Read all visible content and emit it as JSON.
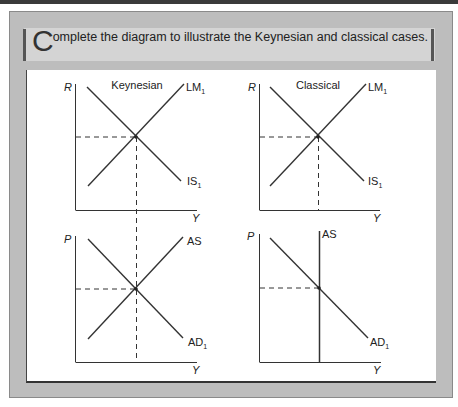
{
  "header": {
    "instruction_dropcap": "C",
    "instruction_rest": "omplete the diagram to illustrate the Keynesian and classical cases."
  },
  "panels": {
    "keynesian_islm": {
      "title": "Keynesian",
      "y_axis_label": "R",
      "x_axis_label": "Y",
      "curve_1_label": "LM",
      "curve_1_sub": "1",
      "curve_2_label": "IS",
      "curve_2_sub": "1"
    },
    "classical_islm": {
      "title": "Classical",
      "y_axis_label": "R",
      "x_axis_label": "Y",
      "curve_1_label": "LM",
      "curve_1_sub": "1",
      "curve_2_label": "IS",
      "curve_2_sub": "1"
    },
    "keynesian_asad": {
      "y_axis_label": "P",
      "x_axis_label": "Y",
      "curve_1_label": "AS",
      "curve_2_label": "AD",
      "curve_2_sub": "1"
    },
    "classical_asad": {
      "y_axis_label": "P",
      "x_axis_label": "Y",
      "curve_1_label": "AS",
      "curve_2_label": "AD",
      "curve_2_sub": "1"
    }
  },
  "colors": {
    "frame_gray": "#bdbdbd",
    "title_strip": "#d4d4d4",
    "line": "#333333"
  }
}
